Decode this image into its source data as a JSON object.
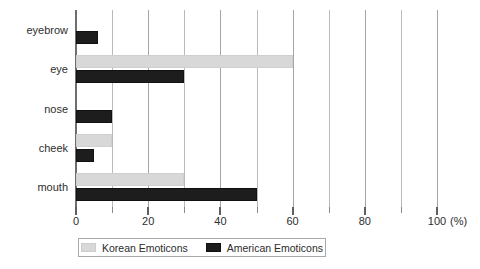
{
  "chart_data": {
    "type": "bar",
    "orientation": "horizontal",
    "title": "",
    "xlabel": "",
    "ylabel": "",
    "unit_label": "(%)",
    "categories": [
      "eyebrow",
      "eye",
      "nose",
      "cheek",
      "mouth"
    ],
    "series": [
      {
        "name": "Korean Emoticons",
        "color": "#d8d8d8",
        "values": [
          0,
          60,
          0,
          10,
          30
        ]
      },
      {
        "name": "American Emoticons",
        "color": "#1d1d1d",
        "values": [
          6,
          30,
          10,
          5,
          50
        ]
      }
    ],
    "xlim": [
      0,
      100
    ],
    "xticks": [
      0,
      20,
      40,
      60,
      80,
      100
    ],
    "xtick_labels": [
      "0",
      "20",
      "40",
      "60",
      "80",
      "100"
    ],
    "minor_xticks": [
      10,
      30,
      50,
      70,
      90
    ],
    "grid": "vertical-only",
    "legend_position": "bottom"
  },
  "legend": {
    "items": [
      {
        "label": "Korean Emoticons",
        "swatch": "korean"
      },
      {
        "label": "American Emoticons",
        "swatch": "american"
      }
    ]
  }
}
